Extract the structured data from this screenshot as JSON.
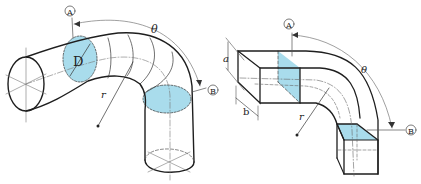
{
  "colors": {
    "line": "#1e1e1e",
    "thin": "#6a6a6a",
    "fill": "#a9dcec",
    "background": "#ffffff"
  },
  "round_bend": {
    "section_a_label": "A",
    "section_b_label": "B",
    "diameter_label": "D",
    "radius_label": "r",
    "angle_label": "θ"
  },
  "rect_bend": {
    "section_a_label": "A",
    "section_b_label": "B",
    "height_label": "a",
    "width_label": "b",
    "radius_label": "r",
    "angle_label": "θ"
  }
}
